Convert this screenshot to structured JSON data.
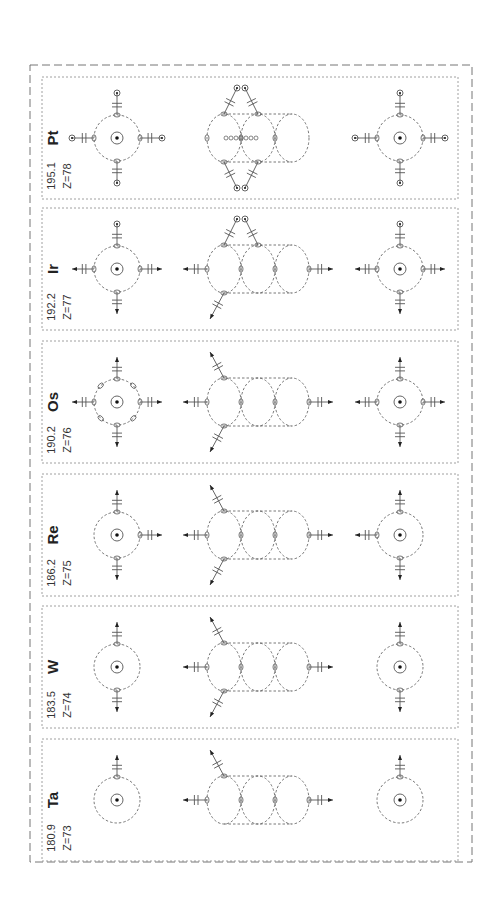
{
  "figure": {
    "title": "",
    "orientation": "rotated-90-ccw",
    "colors": {
      "line": "#555555",
      "text": "#222222",
      "background": "#ffffff"
    }
  },
  "elements": [
    {
      "symbol": "Pt",
      "mass": "195.1",
      "z_label": "Z=78",
      "left_atom": {
        "up": "electron",
        "down": "electron",
        "left": "electron",
        "right": "electron",
        "diagonal_nodes": false
      },
      "middle": {
        "upper_pair": "electron-pair",
        "lower_pair": "electron-pair",
        "left_arm": "none",
        "right_arm": "none",
        "center_chain": true
      },
      "right_atom": {
        "up": "electron",
        "down": "electron",
        "left": "electron",
        "right": "electron"
      }
    },
    {
      "symbol": "Ir",
      "mass": "192.2",
      "z_label": "Z=77",
      "left_atom": {
        "up": "electron",
        "down": "arrow",
        "left": "arrow",
        "right": "arrow",
        "diagonal_nodes": false
      },
      "middle": {
        "upper_pair": "electron-pair",
        "lower_pair": "arrow-single",
        "left_arm": "arrow",
        "right_arm": "arrow",
        "center_chain": false
      },
      "right_atom": {
        "up": "electron",
        "down": "arrow",
        "left": "arrow",
        "right": "arrow"
      }
    },
    {
      "symbol": "Os",
      "mass": "190.2",
      "z_label": "Z=76",
      "left_atom": {
        "up": "arrow",
        "down": "arrow",
        "left": "arrow",
        "right": "arrow",
        "diagonal_nodes": true
      },
      "middle": {
        "upper_pair": "arrow-single",
        "lower_pair": "arrow-single",
        "left_arm": "arrow",
        "right_arm": "arrow",
        "center_chain": false
      },
      "right_atom": {
        "up": "arrow",
        "down": "arrow",
        "left": "arrow",
        "right": "arrow"
      }
    },
    {
      "symbol": "Re",
      "mass": "186.2",
      "z_label": "Z=75",
      "left_atom": {
        "up": "arrow",
        "down": "arrow",
        "left": "none",
        "right": "arrow",
        "diagonal_nodes": false
      },
      "middle": {
        "upper_pair": "arrow-single",
        "lower_pair": "arrow-single",
        "left_arm": "arrow",
        "right_arm": "arrow",
        "center_chain": false
      },
      "right_atom": {
        "up": "arrow",
        "down": "arrow",
        "left": "arrow",
        "right": "none"
      }
    },
    {
      "symbol": "W",
      "mass": "183.5",
      "z_label": "Z=74",
      "left_atom": {
        "up": "arrow",
        "down": "arrow",
        "left": "none",
        "right": "none",
        "diagonal_nodes": false
      },
      "middle": {
        "upper_pair": "arrow-single",
        "lower_pair": "arrow-single",
        "left_arm": "arrow",
        "right_arm": "arrow",
        "center_chain": false
      },
      "right_atom": {
        "up": "arrow",
        "down": "arrow",
        "left": "none",
        "right": "none"
      }
    },
    {
      "symbol": "Ta",
      "mass": "180.9",
      "z_label": "Z=73",
      "left_atom": {
        "up": "arrow",
        "down": "none",
        "left": "none",
        "right": "none",
        "diagonal_nodes": false
      },
      "middle": {
        "upper_pair": "arrow-single",
        "lower_pair": "none",
        "left_arm": "arrow",
        "right_arm": "arrow",
        "center_chain": false
      },
      "right_atom": {
        "up": "arrow",
        "down": "none",
        "left": "none",
        "right": "none"
      }
    }
  ]
}
